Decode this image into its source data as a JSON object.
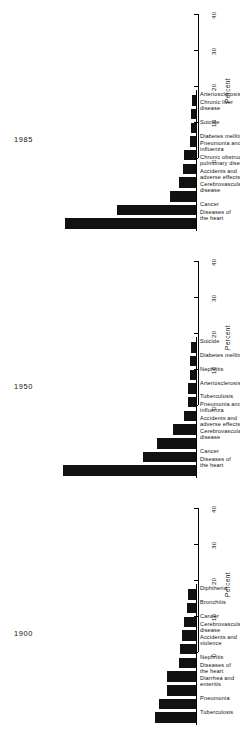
{
  "figure": {
    "axis_title": "Percent",
    "tick_labels": [
      "0",
      "10",
      "20",
      "30",
      "40"
    ],
    "axis_min": 0,
    "axis_max": 40,
    "bar_color": "#111111",
    "axis_color": "#000000"
  },
  "chart_data": [
    {
      "type": "bar",
      "title": "1985",
      "xlabel": "",
      "ylabel": "Percent",
      "ylim": [
        0,
        40
      ],
      "grid": false,
      "orientation": "vertical",
      "categories": [
        "Diseases of\nthe heart",
        "Cancer",
        "Cerebrovascular\ndisease",
        "Accidents and\nadverse effects",
        "Chronic obstructive\npulmonary diseases",
        "Pneumonia and\ninfluenza",
        "Diabetes mellitus",
        "Suicide",
        "Chronic liver\ndisease",
        "Arteriosclerosis"
      ],
      "values": [
        36.5,
        22.0,
        7.2,
        4.6,
        3.7,
        3.4,
        1.8,
        1.4,
        1.3,
        1.0
      ]
    },
    {
      "type": "bar",
      "title": "1950",
      "xlabel": "",
      "ylabel": "Percent",
      "ylim": [
        0,
        40
      ],
      "grid": false,
      "orientation": "vertical",
      "categories": [
        "Diseases of\nthe heart",
        "Cancer",
        "Cerebrovascular\ndisease",
        "Accidents and\nadverse effects",
        "Pneumonia and\ninfluenza",
        "Tuberculosis",
        "Arteriosclerosis",
        "Nephritis",
        "Diabetes mellitus",
        "Suicide"
      ],
      "values": [
        37.0,
        14.6,
        10.8,
        6.4,
        3.3,
        2.3,
        2.2,
        1.7,
        1.7,
        1.3
      ]
    },
    {
      "type": "bar",
      "title": "1900",
      "xlabel": "",
      "ylabel": "Percent",
      "ylim": [
        0,
        40
      ],
      "grid": false,
      "orientation": "vertical",
      "categories": [
        "Tuberculosis",
        "Pneumonia",
        "Diarrhea and\nenteritis",
        "Diseases of\nthe heart",
        "Nephritis",
        "Accidents and\nviolence",
        "Cerebrovascular\ndisease",
        "Cancer",
        "Bronchitis",
        "Diphtheria"
      ],
      "values": [
        11.3,
        10.2,
        8.1,
        8.0,
        4.7,
        4.5,
        4.0,
        3.4,
        2.6,
        2.3
      ]
    }
  ]
}
